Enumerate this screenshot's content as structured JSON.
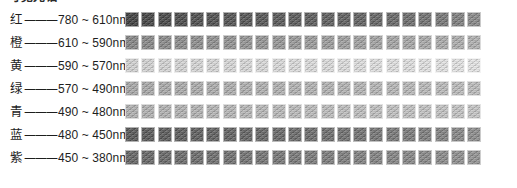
{
  "heading": {
    "text": "可见光谱",
    "clipped": true
  },
  "table": {
    "separator": "———",
    "unit": "nm",
    "tilde": "~",
    "swatch_count": 22,
    "rows": [
      {
        "name": "红",
        "from": "780",
        "to": "610",
        "range": "780 ~ 610nm",
        "base_color": "#4b4b4b",
        "swatch_colors": [
          "#3e3e3e",
          "#434343",
          "#474747",
          "#4a4a4a",
          "#4d4d4d",
          "#4f4f4f",
          "#525252",
          "#545454",
          "#565656",
          "#585858",
          "#5a5a5a",
          "#5c5c5c",
          "#5e5e5e",
          "#5f5f5f",
          "#616161",
          "#646464",
          "#686868",
          "#6c6c6c",
          "#717171",
          "#777777",
          "#7f7f7f",
          "#898989"
        ]
      },
      {
        "name": "橙",
        "from": "610",
        "to": "590",
        "range": "610 ~ 590nm",
        "base_color": "#8a8a8a",
        "swatch_colors": [
          "#868686",
          "#888888",
          "#8a8a8a",
          "#8c8c8c",
          "#8e8e8e",
          "#909090",
          "#929292",
          "#949494",
          "#959595",
          "#979797",
          "#999999",
          "#9b9b9b",
          "#9d9d9d",
          "#9f9f9f",
          "#a1a1a1",
          "#a3a3a3",
          "#a5a5a5",
          "#a7a7a7",
          "#a9a9a9",
          "#ababab",
          "#adadad",
          "#b0b0b0"
        ]
      },
      {
        "name": "黄",
        "from": "590",
        "to": "570",
        "range": "590 ~ 570nm",
        "base_color": "#d6d6d6",
        "swatch_colors": [
          "#d2d2d2",
          "#d3d3d3",
          "#d4d4d4",
          "#d5d5d5",
          "#d6d6d6",
          "#d7d7d7",
          "#d8d8d8",
          "#d8d8d8",
          "#d9d9d9",
          "#dadada",
          "#dbdbdb",
          "#dcdcdc",
          "#dcdcdc",
          "#dddddd",
          "#dedede",
          "#dfdfdf",
          "#e0e0e0",
          "#e0e0e0",
          "#e1e1e1",
          "#e2e2e2",
          "#e3e3e3",
          "#e4e4e4"
        ]
      },
      {
        "name": "绿",
        "from": "570",
        "to": "490",
        "range": "570 ~ 490nm",
        "base_color": "#acacac",
        "swatch_colors": [
          "#a8a8a8",
          "#a9a9a9",
          "#aaaaaa",
          "#ababab",
          "#acacac",
          "#adadad",
          "#aeaeae",
          "#afafaf",
          "#b0b0b0",
          "#b1b1b1",
          "#b2b2b2",
          "#b3b3b3",
          "#b3b3b3",
          "#b4b4b4",
          "#b5b5b5",
          "#b6b6b6",
          "#b7b7b7",
          "#b8b8b8",
          "#b9b9b9",
          "#bababa",
          "#bbbbbb",
          "#bcbcbc"
        ]
      },
      {
        "name": "青",
        "from": "490",
        "to": "480",
        "range": "490 ~ 480nm",
        "base_color": "#b4b4b4",
        "swatch_colors": [
          "#b0b0b0",
          "#b1b1b1",
          "#b2b2b2",
          "#b3b3b3",
          "#b4b4b4",
          "#b5b5b5",
          "#b6b6b6",
          "#b7b7b7",
          "#b8b8b8",
          "#b9b9b9",
          "#bababa",
          "#bbbbbb",
          "#bcbcbc",
          "#bdbdbd",
          "#bebebe",
          "#bfbfbf",
          "#c0c0c0",
          "#c1c1c1",
          "#c2c2c2",
          "#c3c3c3",
          "#c4c4c4",
          "#c5c5c5"
        ]
      },
      {
        "name": "蓝",
        "from": "480",
        "to": "450",
        "range": "480 ~ 450nm",
        "base_color": "#5e5e5e",
        "swatch_colors": [
          "#565656",
          "#585858",
          "#5a5a5a",
          "#5c5c5c",
          "#5e5e5e",
          "#606060",
          "#626262",
          "#646464",
          "#666666",
          "#686868",
          "#6a6a6a",
          "#6c6c6c",
          "#6e6e6e",
          "#707070",
          "#727272",
          "#757575",
          "#787878",
          "#7b7b7b",
          "#7e7e7e",
          "#828282",
          "#868686",
          "#8c8c8c"
        ]
      },
      {
        "name": "紫",
        "from": "450",
        "to": "380",
        "range": "450 ~ 380nm",
        "base_color": "#6f6f6f",
        "swatch_colors": [
          "#646464",
          "#666666",
          "#686868",
          "#6a6a6a",
          "#6c6c6c",
          "#6e6e6e",
          "#707070",
          "#727272",
          "#747474",
          "#767676",
          "#787878",
          "#7a7a7a",
          "#7c7c7c",
          "#7e7e7e",
          "#808080",
          "#828282",
          "#848484",
          "#868686",
          "#888888",
          "#8b8b8b",
          "#8e8e8e",
          "#929292"
        ]
      }
    ]
  }
}
